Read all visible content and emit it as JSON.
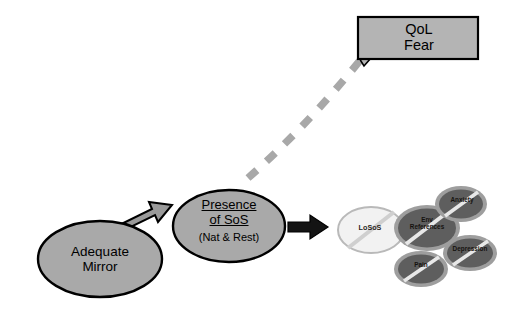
{
  "diagram": {
    "background": "#ffffff",
    "colors": {
      "node_fill": "#a9a9a9",
      "node_stroke": "#000000",
      "arrow_gray_fill": "#9a9a9a",
      "arrow_black_fill": "#141414",
      "dashed_line": "#a8a8a8",
      "callout_fill": "#b4b4b4",
      "callout_stroke": "#000000",
      "consequence_fill": "#5e5e5e",
      "consequence_halo": "#9e9e9e",
      "loss_fill": "#f2f2f2",
      "loss_stroke": "#b9b9b9",
      "strike_color": "#e8e8e8",
      "text": "#000000"
    },
    "nodes": {
      "mirror": {
        "label": "Adequate\nMirror",
        "line1": "Adequate",
        "line2": "Mirror",
        "shape": "ellipse"
      },
      "presence_sos": {
        "line1": "Presence",
        "line2": "of SoS",
        "line3": "(Nat & Rest)",
        "shape": "ellipse",
        "underlined": true
      },
      "qol_fear": {
        "line1": "QoL",
        "line2": "Fear",
        "shape": "callout-box"
      }
    },
    "consequences": [
      {
        "id": "losos",
        "label": "LoSoS",
        "struck": true,
        "variant": "light"
      },
      {
        "id": "env",
        "label_line1": "Env",
        "label_line2": "References",
        "struck": true,
        "variant": "dark"
      },
      {
        "id": "anxiety",
        "label": "Anxiety",
        "struck": true,
        "variant": "dark"
      },
      {
        "id": "depression",
        "label": "Depression",
        "struck": true,
        "variant": "dark"
      },
      {
        "id": "pain",
        "label": "Pain",
        "struck": true,
        "variant": "dark"
      }
    ],
    "connectors": [
      {
        "id": "mirror-to-sos",
        "style": "block-arrow",
        "fill": "gray",
        "from": "mirror",
        "to": "presence_sos"
      },
      {
        "id": "sos-to-outcome",
        "style": "block-arrow",
        "fill": "black",
        "from": "presence_sos",
        "to": "losos"
      },
      {
        "id": "sos-to-qol",
        "style": "dashed-curve",
        "fill": "gray",
        "from": "presence_sos",
        "to": "qol_fear"
      }
    ]
  }
}
